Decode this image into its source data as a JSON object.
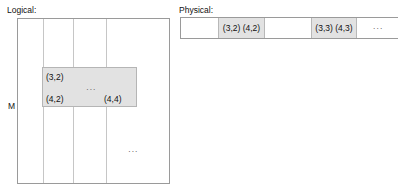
{
  "diagram": {
    "type": "logical-to-physical-mapping",
    "logical": {
      "caption": "Logical:",
      "row_axis_label": "M",
      "column_dividers": [
        25,
        55,
        88
      ],
      "grid": {
        "x": 17,
        "y": 18,
        "width": 153,
        "height": 166
      },
      "highlight": {
        "x": 42,
        "y": 67,
        "width": 95,
        "height": 40,
        "fill": "#e2e2e2",
        "cells": [
          {
            "label": "(3,2)",
            "position": "top-left"
          },
          {
            "label": "(4,2)",
            "position": "bottom-left"
          },
          {
            "label": "(4,4)",
            "position": "bottom-right"
          },
          {
            "label": "···",
            "position": "center"
          }
        ]
      },
      "lower_ellipsis": "···"
    },
    "physical": {
      "caption": "Physical:",
      "bar": {
        "x": 180,
        "y": 17,
        "width": 218,
        "height": 22
      },
      "cells": [
        {
          "label": "",
          "shaded": false,
          "width": 38
        },
        {
          "label": "(3,2)  (4,2)",
          "shaded": true,
          "width": 46
        },
        {
          "label": "",
          "shaded": false,
          "width": 47
        },
        {
          "label": "(3,3)  (4,3)",
          "shaded": true,
          "width": 45
        },
        {
          "label": "···",
          "shaded": false,
          "width": 42
        }
      ]
    },
    "colors": {
      "shade": "#e2e2e2",
      "border": "#9a9a9a",
      "grid_line": "#c6c6c6",
      "text": "#111111",
      "background": "#ffffff"
    }
  }
}
